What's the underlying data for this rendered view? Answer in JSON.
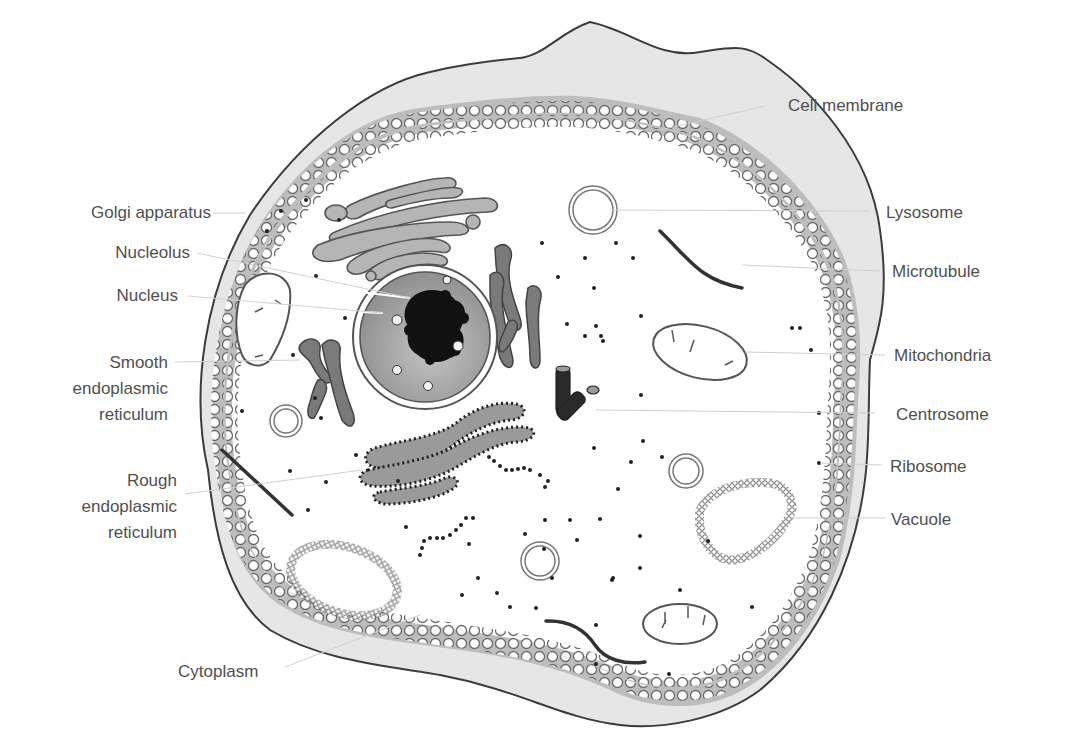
{
  "diagram": {
    "colors": {
      "background": "#ffffff",
      "text": "#505050",
      "outline": "#3c3c3c",
      "membrane_fill": "#e6e6e6",
      "membrane_band": "#b8b8b8",
      "organelle_fill": "#b5b5b5",
      "organelle_dark": "#7a7a7a",
      "nucleus_fill": "#9c9c9c",
      "chromatin": "#111111",
      "leader_line": "#cfcfcf"
    },
    "labels_left": [
      {
        "id": "golgi",
        "text": "Golgi apparatus"
      },
      {
        "id": "nucleolus",
        "text": "Nucleolus"
      },
      {
        "id": "nucleus",
        "text": "Nucleus"
      },
      {
        "id": "smooth_er",
        "lines": [
          "Smooth",
          "endoplasmic",
          "reticulum"
        ]
      },
      {
        "id": "rough_er",
        "lines": [
          "Rough",
          "endoplasmic",
          "reticulum"
        ]
      },
      {
        "id": "cytoplasm",
        "text": "Cytoplasm"
      }
    ],
    "labels_right": [
      {
        "id": "cell_membrane",
        "text": "Cell membrane"
      },
      {
        "id": "lysosome",
        "text": "Lysosome"
      },
      {
        "id": "microtubule",
        "text": "Microtubule"
      },
      {
        "id": "mitochondria",
        "text": "Mitochondria"
      },
      {
        "id": "centrosome",
        "text": "Centrosome"
      },
      {
        "id": "ribosome",
        "text": "Ribosome"
      },
      {
        "id": "vacuole",
        "text": "Vacuole"
      }
    ]
  }
}
